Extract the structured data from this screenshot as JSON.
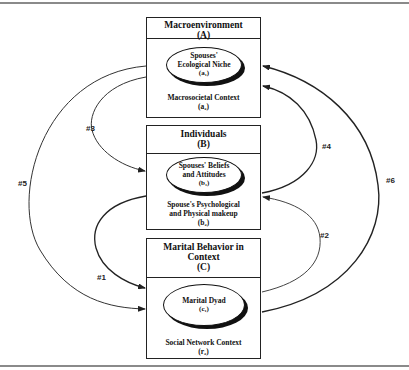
{
  "boxes": {
    "a": {
      "title": "Macroenvironment",
      "letter": "(A)",
      "ellipse_line1": "Spouses'",
      "ellipse_line2": "Ecological Niche",
      "ellipse_sym": "(a₁)",
      "context_line1": "Macrosocietal Context",
      "context_sym": "(a₂)"
    },
    "b": {
      "title": "Individuals",
      "letter": "(B)",
      "ellipse_line1": "Spouses' Beliefs",
      "ellipse_line2": "and Attitudes",
      "ellipse_sym": "(b₁)",
      "context_line1": "Spouse's Psychological",
      "context_line2": "and Physical makeup",
      "context_sym": "(b₂)"
    },
    "c": {
      "title_line1": "Marital Behavior in",
      "title_line2": "Context",
      "letter": "(C)",
      "ellipse_line1": "Marital Dyad",
      "ellipse_sym": "(c₁)",
      "context_line1": "Social Network Context",
      "context_sym": "(r₂)"
    }
  },
  "arrows": [
    {
      "label": "#1",
      "from": "B",
      "to": "C",
      "side": "left"
    },
    {
      "label": "#2",
      "from": "C",
      "to": "B",
      "side": "right"
    },
    {
      "label": "#3",
      "from": "A",
      "to": "B",
      "side": "left"
    },
    {
      "label": "#4",
      "from": "B",
      "to": "A",
      "side": "right"
    },
    {
      "label": "#5",
      "from": "A",
      "to": "C",
      "side": "left"
    },
    {
      "label": "#6",
      "from": "C",
      "to": "A",
      "side": "right"
    }
  ],
  "colors": {
    "line": "#222222",
    "frame": "#8a8a8a",
    "background": "#ffffff"
  }
}
